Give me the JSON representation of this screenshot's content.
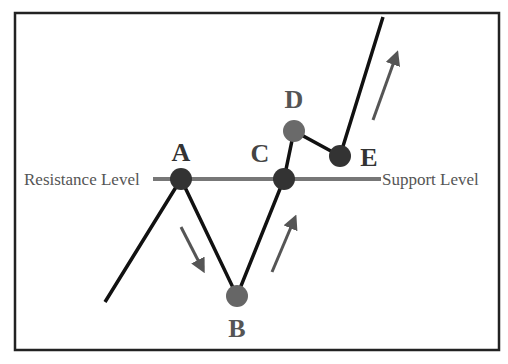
{
  "diagram": {
    "labels": {
      "resistance": "Resistance Level",
      "support": "Support Level"
    },
    "points": [
      {
        "id": "A",
        "label": "A",
        "x": 181,
        "y": 179,
        "color": "#333333"
      },
      {
        "id": "B",
        "label": "B",
        "x": 237,
        "y": 296,
        "color": "#666666"
      },
      {
        "id": "C",
        "label": "C",
        "x": 284,
        "y": 179,
        "color": "#333333"
      },
      {
        "id": "D",
        "label": "D",
        "x": 294,
        "y": 131,
        "color": "#6a6a6a"
      },
      {
        "id": "E",
        "label": "E",
        "x": 340,
        "y": 156,
        "color": "#333333"
      }
    ],
    "colors": {
      "line": "#111111",
      "level_line": "#777777",
      "arrow": "#555555",
      "border": "#222222",
      "text_gray": "#555555"
    }
  }
}
